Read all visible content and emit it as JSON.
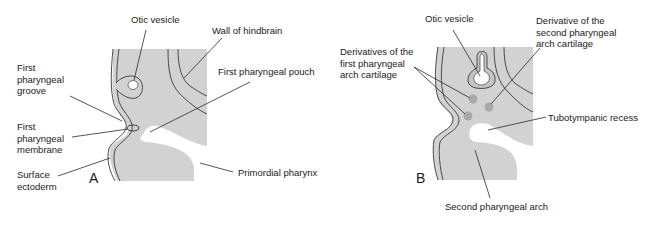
{
  "colors": {
    "tissue": "#d2d2d2",
    "outline": "#3a3a3a",
    "background": "#ffffff",
    "cartilage": "#a9a9a9",
    "text": "#1a1a1a"
  },
  "panel_a": {
    "letter": "A",
    "labels": {
      "otic_vesicle": "Otic vesicle",
      "wall_of_hindbrain": "Wall of hindbrain",
      "first_pharyngeal_groove": "First\npharyngeal\ngroove",
      "first_pharyngeal_pouch": "First pharyngeal pouch",
      "first_pharyngeal_membrane": "First\npharyngeal\nmembrane",
      "surface_ectoderm": "Surface\nectoderm",
      "primordial_pharynx": "Primordial pharynx"
    }
  },
  "panel_b": {
    "letter": "B",
    "labels": {
      "otic_vesicle": "Otic vesicle",
      "derivative_second_arch": "Derivative of the\nsecond pharyngeal\narch cartilage",
      "derivatives_first_arch": "Derivatives of the\nfirst pharyngeal\narch cartilage",
      "tubotympanic_recess": "Tubotympanic recess",
      "second_pharyngeal_arch": "Second pharyngeal arch"
    }
  }
}
